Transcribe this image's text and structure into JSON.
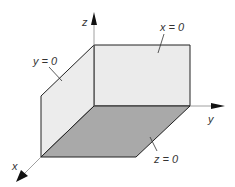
{
  "diagram": {
    "type": "3d-coordinate-planes",
    "axes": {
      "x": {
        "label": "x"
      },
      "y": {
        "label": "y"
      },
      "z": {
        "label": "z"
      }
    },
    "planes": [
      {
        "id": "x0",
        "label": "x = 0",
        "color": "#ebebeb"
      },
      {
        "id": "y0",
        "label": "y = 0",
        "color": "#ebebeb"
      },
      {
        "id": "z0",
        "label": "z = 0",
        "color": "#a9a9a9"
      }
    ],
    "colors": {
      "line": "#222222",
      "axis": "#888888",
      "arrow": "#111111"
    }
  }
}
